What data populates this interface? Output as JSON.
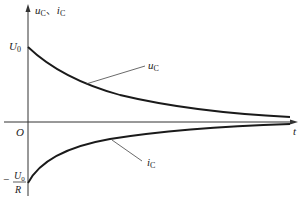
{
  "diagram": {
    "y_axis_label": {
      "u": "u",
      "u_sub": "C",
      "sep": "、",
      "i": "i",
      "i_sub": "C"
    },
    "x_axis_label": "t",
    "origin_label": "O",
    "u0_label": {
      "main": "U",
      "sub": "0"
    },
    "neg_u0_over_r": {
      "sign": "−",
      "num_main": "U",
      "num_sub": "0",
      "den": "R"
    },
    "curves": [
      {
        "name": "u_C",
        "label_main": "u",
        "label_sub": "C",
        "description": "exponential decay from U0 toward 0"
      },
      {
        "name": "i_C",
        "label_main": "i",
        "label_sub": "C",
        "description": "exponential rise from -U0/R toward 0"
      }
    ],
    "colors": {
      "stroke": "#1a1a1a",
      "axis": "#333333"
    }
  }
}
